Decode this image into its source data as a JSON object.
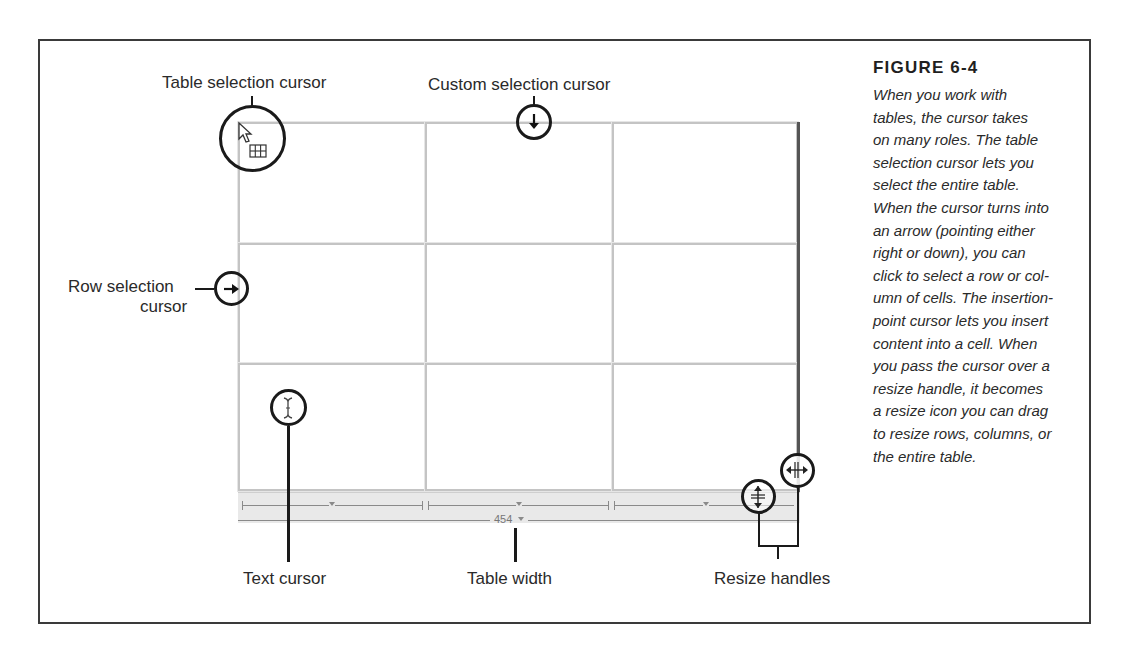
{
  "figure": {
    "title": "FIGURE 6-4",
    "caption_lines": [
      "When you work with",
      "tables, the cursor takes",
      "on many roles. The table",
      "selection cursor lets you",
      "select the entire table.",
      "When the cursor turns into",
      "an arrow (pointing either",
      "right or down), you can",
      "click to select a row or col-",
      "umn of cells. The insertion-",
      "point cursor lets you insert",
      "content into a cell. When",
      "you pass the cursor over a",
      "resize handle, it becomes",
      "a resize icon you can drag",
      "to resize rows, columns, or",
      "the entire table."
    ]
  },
  "callouts": {
    "table_selection": "Table selection cursor",
    "custom_selection": "Custom selection cursor",
    "row_selection_line1": "Row selection",
    "row_selection_line2": "cursor",
    "text_cursor": "Text cursor",
    "table_width": "Table width",
    "resize_handles": "Resize handles"
  },
  "table": {
    "rows": 3,
    "columns": 3,
    "width_value": "454"
  },
  "colors": {
    "frame": "#3a3a3a",
    "cell_border": "#c4c4c4",
    "width_bar": "#e9e9e9",
    "callout_ink": "#1a1a1a"
  }
}
